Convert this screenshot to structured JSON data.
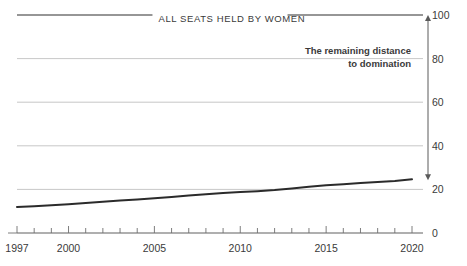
{
  "chart_data": {
    "type": "line",
    "title": "",
    "xlabel": "",
    "ylabel": "",
    "xlim": [
      1997,
      2020
    ],
    "ylim": [
      0,
      100
    ],
    "grid": true,
    "legend_position": "none",
    "x": [
      1997,
      1998,
      1999,
      2000,
      2001,
      2002,
      2003,
      2004,
      2005,
      2006,
      2007,
      2008,
      2009,
      2010,
      2011,
      2012,
      2013,
      2014,
      2015,
      2016,
      2017,
      2018,
      2019,
      2020
    ],
    "series": [
      {
        "name": "Share of parliamentary seats held by women",
        "values": [
          11.9,
          12.3,
          12.7,
          13.2,
          13.8,
          14.3,
          14.9,
          15.4,
          15.9,
          16.5,
          17.2,
          17.8,
          18.3,
          18.8,
          19.2,
          19.7,
          20.4,
          21.2,
          21.9,
          22.4,
          22.9,
          23.4,
          23.9,
          24.6
        ]
      }
    ],
    "yticks": [
      0,
      20,
      40,
      60,
      80,
      100
    ],
    "ytick_labels": [
      "0",
      "20",
      "40",
      "60",
      "80",
      "100"
    ],
    "xticks": [
      1997,
      2000,
      2005,
      2010,
      2015,
      2020
    ],
    "xtick_labels": [
      "1997",
      "2000",
      "2005",
      "2010",
      "2015",
      "2020"
    ],
    "top_reference_label": "ALL SEATS HELD BY WOMEN",
    "top_reference_value": 100,
    "annotations": [
      {
        "name": "remaining-distance",
        "line1": "The remaining distance",
        "line2": "to domination",
        "arrow_from": 100,
        "arrow_to": 24.6
      }
    ],
    "colors": {
      "line": "#2b2b2b",
      "grid": "#b9b9b9",
      "axis": "#6f6f6f",
      "text": "#3a3a3a",
      "annotation": "#1d1d1d"
    }
  }
}
